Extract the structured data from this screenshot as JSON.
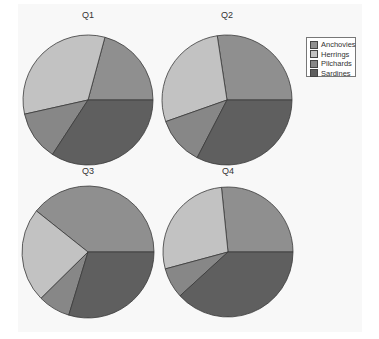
{
  "chart_data": [
    {
      "type": "pie",
      "title": "Q1",
      "categories": [
        "Anchovies",
        "Herrings",
        "Pilchards",
        "Sardines"
      ],
      "values": [
        20.8,
        32.7,
        12.3,
        34.2
      ],
      "start_angle_deg": 0,
      "direction": "counterclockwise"
    },
    {
      "type": "pie",
      "title": "Q2",
      "categories": [
        "Anchovies",
        "Herrings",
        "Pilchards",
        "Sardines"
      ],
      "values": [
        27.4,
        28.0,
        12.0,
        32.6
      ],
      "start_angle_deg": 0,
      "direction": "counterclockwise"
    },
    {
      "type": "pie",
      "title": "Q3",
      "categories": [
        "Anchovies",
        "Herrings",
        "Pilchards",
        "Sardines"
      ],
      "values": [
        39.3,
        23.1,
        7.9,
        29.7
      ],
      "start_angle_deg": 0,
      "direction": "counterclockwise"
    },
    {
      "type": "pie",
      "title": "Q4",
      "categories": [
        "Anchovies",
        "Herrings",
        "Pilchards",
        "Sardines"
      ],
      "values": [
        26.6,
        27.6,
        7.6,
        38.2
      ],
      "start_angle_deg": 0,
      "direction": "counterclockwise"
    }
  ],
  "legend": {
    "position": "top-right",
    "items": [
      {
        "label": "Anchovies",
        "color": "#8f8f8f"
      },
      {
        "label": "Herrings",
        "color": "#c2c2c2"
      },
      {
        "label": "Pilchards",
        "color": "#878787"
      },
      {
        "label": "Sardines",
        "color": "#5f5f5f"
      }
    ]
  },
  "layout": {
    "pies": [
      {
        "cx": 88,
        "cy": 100,
        "r": 65,
        "title_y": 18
      },
      {
        "cx": 227,
        "cy": 100,
        "r": 65,
        "title_y": 18
      },
      {
        "cx": 88,
        "cy": 252,
        "r": 66,
        "title_y": 174
      },
      {
        "cx": 228,
        "cy": 252,
        "r": 65,
        "title_y": 174
      }
    ],
    "edge_color": "#3a3a3a"
  }
}
